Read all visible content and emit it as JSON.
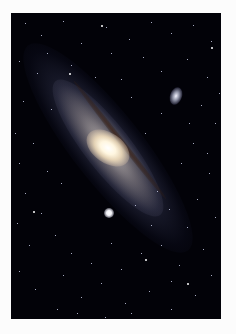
{
  "image": {
    "subject": "spiral galaxy with two companion galaxies in a starfield",
    "background_color": "#fcfcfc",
    "sky_color": "#020208",
    "core_color": "#fff6e0",
    "dust_color": "#3c1e0f"
  },
  "stars": [
    [
      14,
      10
    ],
    [
      30,
      22
    ],
    [
      52,
      8
    ],
    [
      70,
      30
    ],
    [
      95,
      14
    ],
    [
      118,
      26
    ],
    [
      140,
      9
    ],
    [
      160,
      20
    ],
    [
      182,
      12
    ],
    [
      200,
      28
    ],
    [
      8,
      48
    ],
    [
      26,
      60
    ],
    [
      60,
      52
    ],
    [
      132,
      44
    ],
    [
      150,
      58
    ],
    [
      176,
      46
    ],
    [
      196,
      64
    ],
    [
      12,
      88
    ],
    [
      40,
      96
    ],
    [
      120,
      84
    ],
    [
      190,
      92
    ],
    [
      204,
      110
    ],
    [
      182,
      130
    ],
    [
      170,
      150
    ],
    [
      198,
      160
    ],
    [
      186,
      186
    ],
    [
      204,
      204
    ],
    [
      176,
      214
    ],
    [
      192,
      236
    ],
    [
      168,
      252
    ],
    [
      200,
      262
    ],
    [
      184,
      282
    ],
    [
      160,
      296
    ],
    [
      138,
      278
    ],
    [
      114,
      290
    ],
    [
      90,
      270
    ],
    [
      70,
      284
    ],
    [
      46,
      296
    ],
    [
      24,
      276
    ],
    [
      8,
      258
    ],
    [
      18,
      232
    ],
    [
      6,
      210
    ],
    [
      30,
      200
    ],
    [
      14,
      180
    ],
    [
      8,
      150
    ],
    [
      22,
      130
    ],
    [
      4,
      120
    ],
    [
      60,
      240
    ],
    [
      80,
      250
    ],
    [
      110,
      256
    ],
    [
      130,
      240
    ],
    [
      150,
      232
    ],
    [
      100,
      230
    ],
    [
      44,
      222
    ],
    [
      52,
      262
    ],
    [
      140,
      212
    ],
    [
      124,
      192
    ],
    [
      146,
      178
    ],
    [
      158,
      196
    ],
    [
      196,
      140
    ],
    [
      208,
      80
    ],
    [
      100,
      40
    ],
    [
      84,
      64
    ],
    [
      110,
      66
    ],
    [
      36,
      40
    ],
    [
      150,
      100
    ],
    [
      178,
      110
    ],
    [
      120,
      300
    ],
    [
      66,
      300
    ],
    [
      94,
      304
    ],
    [
      160,
      268
    ],
    [
      134,
      120
    ],
    [
      50,
      170
    ],
    [
      36,
      158
    ]
  ],
  "bright_stars": [
    [
      58,
      60
    ],
    [
      134,
      246
    ],
    [
      200,
      34
    ],
    [
      22,
      198
    ],
    [
      176,
      270
    ],
    [
      90,
      12
    ]
  ]
}
